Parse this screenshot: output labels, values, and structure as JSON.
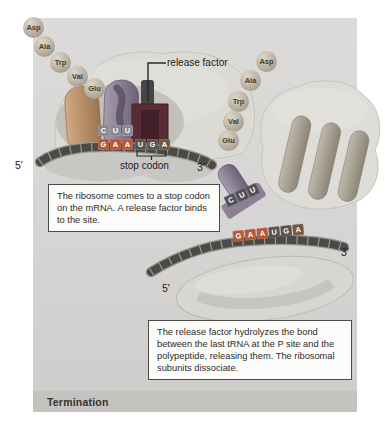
{
  "figure": {
    "stage_label": "Termination"
  },
  "labels": {
    "release_factor": "release factor",
    "stop_codon": "stop codon",
    "five_prime": "5′",
    "three_prime": "3′"
  },
  "amino_acids": [
    "Asp",
    "Ala",
    "Trp",
    "Val",
    "Glu"
  ],
  "codons": {
    "p_site_anticodon": [
      "C",
      "U",
      "U"
    ],
    "glu_codon": [
      "G",
      "A",
      "A"
    ],
    "stop_codon": [
      "U",
      "G",
      "A"
    ],
    "mrna_strand2": [
      "G",
      "A",
      "A",
      "U",
      "G",
      "A"
    ],
    "released_trna_anticodon": [
      "C",
      "U",
      "U"
    ]
  },
  "captions": {
    "step1": "The ribosome comes to a stop codon on the mRNA. A release factor binds to the site.",
    "step2": "The release factor hydrolyzes the bond between the last tRNA at the P site and the polypeptide, releasing them. The ribosomal subunits dissociate."
  },
  "colors": {
    "panel_gray": "#d7d6d4",
    "termination_bar": "#c4c3c0",
    "mrna_dark": "#4b4a46",
    "codon_orange": "#b5593a",
    "codon_dark": "#56544a",
    "anticodon_gray": "#8a8791",
    "trna_purple": "#8b7d92",
    "trna_tan": "#b98f63",
    "release_factor_maroon": "#5a2c35"
  }
}
